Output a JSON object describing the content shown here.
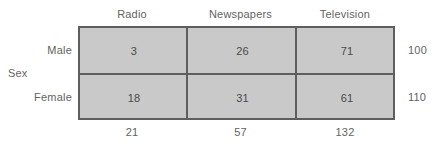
{
  "chart_data": {
    "type": "table",
    "title": "",
    "xlabel": "",
    "ylabel": "Sex",
    "row_variable": "Sex",
    "column_variable": "",
    "categories": [
      "Radio",
      "Newspapers",
      "Television"
    ],
    "row_categories": [
      "Male",
      "Female"
    ],
    "series": [
      {
        "name": "Male",
        "values": [
          3,
          26,
          71
        ]
      },
      {
        "name": "Female",
        "values": [
          18,
          31,
          61
        ]
      }
    ],
    "row_totals": [
      100,
      110
    ],
    "column_totals": [
      21,
      57,
      132
    ],
    "grid": true,
    "legend": "none",
    "cell_fill_color": "#c9c9c9",
    "border_color": "#5e5e5e",
    "text_color": "#636363"
  },
  "table": {
    "row_variable_label": "Sex",
    "column_headers": [
      "Radio",
      "Newspapers",
      "Television"
    ],
    "row_headers": [
      "Male",
      "Female"
    ],
    "cells": [
      [
        "3",
        "26",
        "71"
      ],
      [
        "18",
        "31",
        "61"
      ]
    ],
    "row_totals": [
      "100",
      "110"
    ],
    "column_totals": [
      "21",
      "57",
      "132"
    ]
  }
}
